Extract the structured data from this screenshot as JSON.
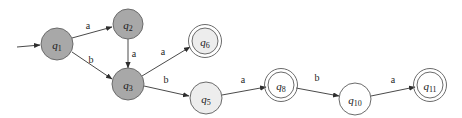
{
  "diagram": {
    "type": "finite-state-automaton",
    "width": 462,
    "height": 118,
    "background_color": "#ffffff",
    "edge_color": "#4a4a4a",
    "node_stroke_color": "#6b6b6b",
    "fill_dark": "#a8a8a8",
    "fill_light": "#ededed",
    "alphabet": [
      "a",
      "b"
    ]
  },
  "states": [
    {
      "id": "q1",
      "label": "q",
      "subscript": "1",
      "cx": 57,
      "cy": 44,
      "r": 16,
      "fill": "#a8a8a8",
      "accepting": false,
      "start": true
    },
    {
      "id": "q2",
      "label": "q",
      "subscript": "2",
      "cx": 128,
      "cy": 24,
      "r": 15,
      "fill": "#a8a8a8",
      "accepting": false,
      "start": false
    },
    {
      "id": "q3",
      "label": "q",
      "subscript": "3",
      "cx": 128,
      "cy": 84,
      "r": 16,
      "fill": "#a8a8a8",
      "accepting": false,
      "start": false
    },
    {
      "id": "q6",
      "label": "q",
      "subscript": "6",
      "cx": 205,
      "cy": 41,
      "r": 13,
      "fill": "#ededed",
      "accepting": true,
      "start": false
    },
    {
      "id": "q5",
      "label": "q",
      "subscript": "5",
      "cx": 206,
      "cy": 98,
      "r": 16,
      "fill": "#ededed",
      "accepting": false,
      "start": false
    },
    {
      "id": "q8",
      "label": "q",
      "subscript": "8",
      "cx": 281,
      "cy": 85,
      "r": 13,
      "fill": "#ffffff",
      "accepting": true,
      "start": false
    },
    {
      "id": "q10",
      "label": "q",
      "subscript": "10",
      "cx": 355,
      "cy": 99,
      "r": 16,
      "fill": "#ffffff",
      "accepting": false,
      "start": false
    },
    {
      "id": "q11",
      "label": "q",
      "subscript": "11",
      "cx": 430,
      "cy": 85,
      "r": 13,
      "fill": "#ffffff",
      "accepting": true,
      "start": false
    }
  ],
  "start_arrow": {
    "from_x": 17,
    "from_y": 47,
    "to_x": 40,
    "to_y": 45
  },
  "transitions": [
    {
      "id": "q1-q2",
      "from": "q1",
      "to": "q2",
      "symbol": "a",
      "x1": 72,
      "y1": 38,
      "x2": 112,
      "y2": 27,
      "label_x": 88,
      "label_y": 25
    },
    {
      "id": "q1-q3",
      "from": "q1",
      "to": "q3",
      "symbol": "b",
      "x1": 72,
      "y1": 52,
      "x2": 112,
      "y2": 79,
      "label_x": 91,
      "label_y": 59
    },
    {
      "id": "q2-q3",
      "from": "q2",
      "to": "q3",
      "symbol": "a",
      "x1": 128,
      "y1": 39,
      "x2": 128,
      "y2": 68,
      "label_x": 134,
      "label_y": 53
    },
    {
      "id": "q3-q6",
      "from": "q3",
      "to": "q6",
      "symbol": "a",
      "x1": 142,
      "y1": 76,
      "x2": 190,
      "y2": 47,
      "label_x": 163,
      "label_y": 51
    },
    {
      "id": "q3-q5",
      "from": "q3",
      "to": "q5",
      "symbol": "b",
      "x1": 144,
      "y1": 86,
      "x2": 189,
      "y2": 96,
      "label_x": 166,
      "label_y": 79
    },
    {
      "id": "q5-q8",
      "from": "q5",
      "to": "q8",
      "symbol": "a",
      "x1": 222,
      "y1": 95,
      "x2": 266,
      "y2": 87,
      "label_x": 243,
      "label_y": 79
    },
    {
      "id": "q8-q10",
      "from": "q8",
      "to": "q10",
      "symbol": "b",
      "x1": 296,
      "y1": 88,
      "x2": 339,
      "y2": 96,
      "label_x": 317,
      "label_y": 77
    },
    {
      "id": "q10-q11",
      "from": "q10",
      "to": "q11",
      "symbol": "a",
      "x1": 371,
      "y1": 96,
      "x2": 415,
      "y2": 87,
      "label_x": 393,
      "label_y": 79
    }
  ]
}
